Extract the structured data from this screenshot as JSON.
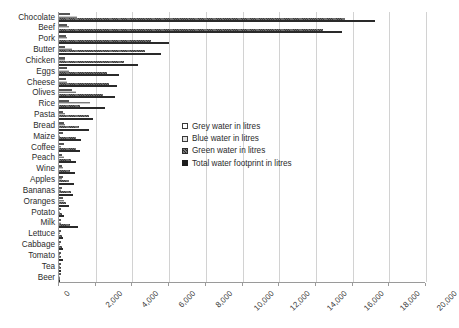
{
  "chart_data": {
    "type": "bar",
    "orientation": "horizontal",
    "title": "",
    "xlabel": "",
    "ylabel": "",
    "xlim": [
      0,
      20000
    ],
    "xticks": [
      0,
      2000,
      4000,
      6000,
      8000,
      10000,
      12000,
      14000,
      16000,
      18000,
      20000
    ],
    "xtick_labels": [
      "0",
      "2,000",
      "4,000",
      "6,000",
      "8,000",
      "10,000",
      "12,000",
      "14,000",
      "16,000",
      "18,000",
      "20,000"
    ],
    "grid": true,
    "legend_position": "center",
    "categories": [
      "Chocolate",
      "Beef",
      "Pork",
      "Butter",
      "Chicken",
      "Eggs",
      "Cheese",
      "Olives",
      "Rice",
      "Pasta",
      "Bread",
      "Maize",
      "Coffee",
      "Peach",
      "Wine",
      "Apples",
      "Bananas",
      "Oranges",
      "Potato",
      "Milk",
      "Lettuce",
      "Cabbage",
      "Tomato",
      "Tea",
      "Beer"
    ],
    "series": [
      {
        "name": "Grey water in litres",
        "key": "grey",
        "color": "#ffffff",
        "values": [
          600,
          450,
          400,
          350,
          300,
          450,
          400,
          700,
          550,
          200,
          250,
          200,
          250,
          150,
          150,
          200,
          150,
          200,
          50,
          70,
          50,
          40,
          50,
          30,
          20
        ]
      },
      {
        "name": "Blue water in litres",
        "key": "blue",
        "color": "#c9c9c9",
        "values": [
          1000,
          550,
          460,
          700,
          350,
          550,
          450,
          900,
          1670,
          300,
          300,
          80,
          120,
          250,
          200,
          180,
          100,
          250,
          30,
          90,
          30,
          30,
          60,
          30,
          20
        ]
      },
      {
        "name": "Green water in litres",
        "key": "green",
        "color": "#6f6f6f",
        "values": [
          15600,
          14400,
          5000,
          4700,
          3550,
          2600,
          2700,
          2400,
          1150,
          1650,
          1100,
          950,
          950,
          650,
          600,
          550,
          650,
          400,
          150,
          600,
          150,
          150,
          100,
          100,
          50
        ]
      },
      {
        "name": "Total water footprint in litres",
        "key": "total",
        "color": "#2a2a2a",
        "values": [
          17196,
          15415,
          5988,
          5553,
          4325,
          3265,
          3178,
          3025,
          2497,
          1849,
          1608,
          1222,
          1120,
          910,
          870,
          822,
          790,
          560,
          287,
          1020,
          237,
          237,
          214,
          108,
          74
        ]
      }
    ]
  },
  "legend": {
    "items": [
      {
        "key": "grey",
        "label": "Grey water in litres"
      },
      {
        "key": "blue",
        "label": "Blue water in litres"
      },
      {
        "key": "green",
        "label": "Green water in litres"
      },
      {
        "key": "total",
        "label": "Total water footprint in litres"
      }
    ]
  }
}
